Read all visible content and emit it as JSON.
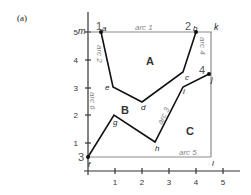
{
  "panel_label": "(a)",
  "axes": {
    "x_ticks": [
      "1",
      "2",
      "3",
      "4",
      "5"
    ],
    "y_ticks": [
      "1",
      "2",
      "3",
      "4",
      "5"
    ],
    "x_range": [
      0,
      5.2
    ],
    "y_range": [
      0,
      5.5
    ]
  },
  "frame": {
    "corners": [
      {
        "id": "m",
        "x": 0,
        "y": 5
      },
      {
        "id": "k",
        "x": 4.6,
        "y": 5
      },
      {
        "id": "l",
        "x": 4.6,
        "y": 0.5
      },
      {
        "id": "f",
        "x": 0,
        "y": 0.5
      }
    ],
    "color": "#888888"
  },
  "arcs": [
    {
      "label": "arc 1",
      "side": "top"
    },
    {
      "label": "arc 2",
      "side": "along a-e"
    },
    {
      "label": "arc 3",
      "side": "along h-i"
    },
    {
      "label": "arc 4",
      "side": "right upper"
    },
    {
      "label": "arc 5",
      "side": "bottom"
    },
    {
      "label": "arc 6",
      "side": "left"
    }
  ],
  "points": [
    {
      "id": "a",
      "x": 0.5,
      "y": 5.0,
      "node": "1"
    },
    {
      "id": "b",
      "x": 4.0,
      "y": 5.0,
      "node": "2"
    },
    {
      "id": "c",
      "x": 3.5,
      "y": 3.55
    },
    {
      "id": "d",
      "x": 2.0,
      "y": 2.5
    },
    {
      "id": "e",
      "x": 0.93,
      "y": 3.0
    },
    {
      "id": "f",
      "x": 0.0,
      "y": 0.5,
      "node": "3"
    },
    {
      "id": "g",
      "x": 1.0,
      "y": 2.0
    },
    {
      "id": "h",
      "x": 2.5,
      "y": 1.05
    },
    {
      "id": "i",
      "x": 3.5,
      "y": 3.0
    },
    {
      "id": "j",
      "x": 4.5,
      "y": 3.5,
      "node": "4"
    }
  ],
  "polylines": [
    {
      "name": "a-b-path",
      "points": [
        "a",
        "e",
        "d",
        "c",
        "b"
      ]
    },
    {
      "name": "f-j-path",
      "points": [
        "f",
        "g",
        "h",
        "i",
        "j"
      ]
    }
  ],
  "regions": [
    {
      "label": "A",
      "x": 2.2,
      "y": 4.1
    },
    {
      "label": "B",
      "x": 1.5,
      "y": 2.3
    },
    {
      "label": "C",
      "x": 3.8,
      "y": 1.6
    }
  ],
  "node_labels": {
    "1": "1",
    "2": "2",
    "3": "3",
    "4": "4"
  },
  "letters": {
    "m": "m",
    "k": "k",
    "l": "l",
    "a": "a",
    "b": "b",
    "c": "c",
    "d": "d",
    "e": "e",
    "f": "f",
    "g": "g",
    "h": "h",
    "i": "i",
    "j": "j"
  },
  "arc_labels": {
    "arc1": "arc 1",
    "arc2": "arc 2",
    "arc3": "arc 3",
    "arc4": "arc 4",
    "arc5": "arc 5",
    "arc6": "arc 6"
  },
  "region_labels": {
    "A": "A",
    "B": "B",
    "C": "C"
  }
}
